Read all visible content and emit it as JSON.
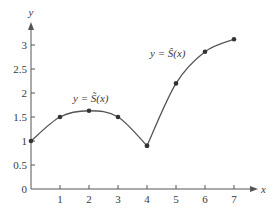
{
  "chart_data": {
    "type": "line",
    "title": "",
    "xlabel": "x",
    "ylabel": "y",
    "xlim": [
      0,
      7.6
    ],
    "ylim": [
      0,
      3.5
    ],
    "x_ticks": [
      1,
      2,
      3,
      4,
      5,
      6,
      7
    ],
    "y_ticks": [
      0,
      0.5,
      1,
      1.5,
      2,
      2.5,
      3
    ],
    "x_tick_labels": [
      "1",
      "2",
      "3",
      "4",
      "5",
      "6",
      "7"
    ],
    "y_tick_labels": [
      "0",
      "0.5",
      "1",
      "1.5",
      "2",
      "2.5",
      "3"
    ],
    "grid": false,
    "series": [
      {
        "name": "y = S̃(x)",
        "x": [
          0,
          1,
          2,
          3,
          4
        ],
        "values": [
          1.0,
          1.5,
          1.63,
          1.5,
          0.9
        ]
      },
      {
        "name": "y = Ŝ(x)",
        "x": [
          4,
          5,
          6,
          7
        ],
        "values": [
          0.9,
          2.2,
          2.86,
          3.12
        ]
      }
    ],
    "annotations": [
      {
        "text": "y = S̃(x)",
        "x": 2.1,
        "y": 1.9
      },
      {
        "text": "y = Ŝ(x)",
        "x": 5.2,
        "y": 3.3
      }
    ],
    "colors": {
      "line": "#555555",
      "points": "#333333",
      "axis": "#555555"
    }
  }
}
